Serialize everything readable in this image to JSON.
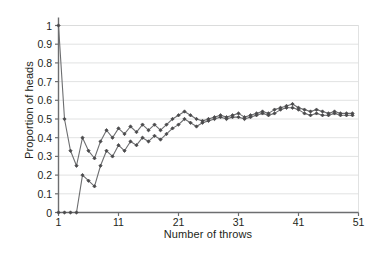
{
  "chart_data": {
    "type": "line",
    "title": "",
    "xlabel": "Number of throws",
    "ylabel": "Proportion of heads",
    "xlim": [
      1,
      51
    ],
    "ylim": [
      0,
      1
    ],
    "xticks": [
      1,
      11,
      21,
      31,
      41,
      51
    ],
    "xtick_labels": [
      "1",
      "11",
      "21",
      "31",
      "41",
      "51"
    ],
    "yticks": [
      0,
      0.1,
      0.2,
      0.3,
      0.4,
      0.5,
      0.6,
      0.7,
      0.8,
      0.9,
      1
    ],
    "ytick_labels": [
      "0",
      "0.1",
      "0.2",
      "0.3",
      "0.4",
      "0.5",
      "0.6",
      "0.7",
      "0.8",
      "0.9",
      "1"
    ],
    "grid": "horizontal",
    "legend": "none",
    "line_color": "#6d6e70",
    "marker_color": "#4a4a4c",
    "grid_color": "#d9dadb",
    "axis_color": "#6d6e70",
    "x": [
      1,
      2,
      3,
      4,
      5,
      6,
      7,
      8,
      9,
      10,
      11,
      12,
      13,
      14,
      15,
      16,
      17,
      18,
      19,
      20,
      21,
      22,
      23,
      24,
      25,
      26,
      27,
      28,
      29,
      30,
      31,
      32,
      33,
      34,
      35,
      36,
      37,
      38,
      39,
      40,
      41,
      42,
      43,
      44,
      45,
      46,
      47,
      48,
      49,
      50
    ],
    "series": [
      {
        "name": "Series A",
        "values": [
          1.0,
          0.5,
          0.33,
          0.25,
          0.4,
          0.33,
          0.29,
          0.38,
          0.44,
          0.4,
          0.45,
          0.42,
          0.46,
          0.43,
          0.47,
          0.44,
          0.47,
          0.44,
          0.47,
          0.5,
          0.52,
          0.54,
          0.52,
          0.5,
          0.49,
          0.5,
          0.51,
          0.52,
          0.51,
          0.52,
          0.53,
          0.51,
          0.52,
          0.53,
          0.54,
          0.53,
          0.55,
          0.56,
          0.57,
          0.58,
          0.56,
          0.55,
          0.54,
          0.55,
          0.54,
          0.53,
          0.54,
          0.53,
          0.53,
          0.53
        ]
      },
      {
        "name": "Series B",
        "values": [
          0.0,
          0.0,
          0.0,
          0.0,
          0.2,
          0.17,
          0.14,
          0.25,
          0.33,
          0.3,
          0.36,
          0.33,
          0.38,
          0.36,
          0.4,
          0.38,
          0.41,
          0.39,
          0.42,
          0.45,
          0.47,
          0.5,
          0.48,
          0.46,
          0.48,
          0.49,
          0.5,
          0.51,
          0.5,
          0.51,
          0.51,
          0.5,
          0.51,
          0.52,
          0.53,
          0.52,
          0.53,
          0.55,
          0.56,
          0.56,
          0.55,
          0.53,
          0.52,
          0.53,
          0.52,
          0.52,
          0.53,
          0.52,
          0.52,
          0.52
        ]
      }
    ]
  }
}
